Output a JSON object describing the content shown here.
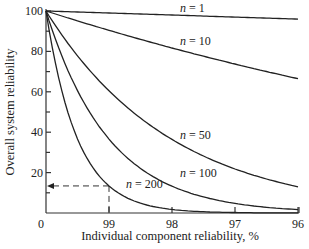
{
  "chart_data": {
    "type": "line",
    "title": "",
    "xlabel": "Individual component reliability, %",
    "ylabel": "Overall system reliability",
    "x_ticks": [
      "0",
      "99",
      "98",
      "97",
      "96"
    ],
    "y_ticks": [
      "100",
      "80",
      "60",
      "40",
      "20"
    ],
    "xlim": [
      100,
      96
    ],
    "ylim": [
      0,
      100
    ],
    "x": [
      100,
      99.5,
      99,
      98.5,
      98,
      97.5,
      97,
      96.5,
      96
    ],
    "series": [
      {
        "name": "n = 1",
        "label_text": "n = 1",
        "values": [
          100,
          99.5,
          99,
          98.5,
          98,
          97.5,
          97,
          96.5,
          96
        ]
      },
      {
        "name": "n = 10",
        "label_text": "n = 10",
        "values": [
          100,
          95.1,
          90.4,
          86.0,
          81.7,
          77.6,
          73.7,
          70.0,
          66.5
        ]
      },
      {
        "name": "n = 50",
        "label_text": "n = 50",
        "values": [
          100,
          77.8,
          60.5,
          47.0,
          36.4,
          28.2,
          21.8,
          16.9,
          13.0
        ]
      },
      {
        "name": "n = 100",
        "label_text": "n = 100",
        "values": [
          100,
          60.6,
          36.6,
          22.1,
          13.3,
          7.9,
          4.8,
          2.8,
          1.7
        ]
      },
      {
        "name": "n = 200",
        "label_text": "n = 200",
        "values": [
          100,
          36.7,
          13.4,
          4.9,
          1.8,
          0.6,
          0.2,
          0.1,
          0.0
        ]
      }
    ],
    "annotations": [
      {
        "type": "dashed-guide",
        "from_x": 99,
        "to_y": 13.4,
        "arrow": "to y-axis",
        "note": "n = 200 at 99% component reliability"
      }
    ],
    "grid": false,
    "legend": "inline labels on curves"
  },
  "labels": {
    "n1": {
      "var": "n",
      "rest": " = 1"
    },
    "n10": {
      "var": "n",
      "rest": " = 10"
    },
    "n50": {
      "var": "n",
      "rest": " = 50"
    },
    "n100": {
      "var": "n",
      "rest": " = 100"
    },
    "n200": {
      "var": "n",
      "rest": " = 200"
    }
  }
}
